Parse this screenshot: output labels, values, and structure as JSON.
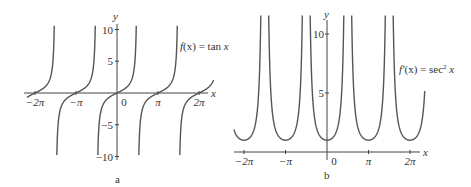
{
  "chart_data": [
    {
      "panel": "a",
      "type": "line",
      "title": "",
      "annotation": "f(x) = tan x",
      "function": "tan x",
      "xlabel": "x",
      "ylabel": "y",
      "xlim": [
        -6.9,
        7.3
      ],
      "ylim": [
        -10,
        11
      ],
      "x_ticks": [
        "−2π",
        "−π",
        "0",
        "π",
        "2π"
      ],
      "y_ticks": [
        "10",
        "5",
        "−5",
        "−10"
      ],
      "asymptotes": [
        "-3π/2",
        "-π/2",
        "π/2",
        "3π/2"
      ],
      "grid": false,
      "caption": "a"
    },
    {
      "panel": "b",
      "type": "line",
      "title": "",
      "annotation": "f′(x) = sec² x",
      "function": "sec^2 x",
      "xlabel": "x",
      "ylabel": "y",
      "xlim": [
        -7,
        7.3
      ],
      "ylim": [
        0,
        11
      ],
      "x_ticks": [
        "−2π",
        "−π",
        "0",
        "π",
        "2π"
      ],
      "y_ticks": [
        "10",
        "5"
      ],
      "minimum_value": 1,
      "asymptotes": [
        "-3π/2",
        "-π/2",
        "π/2",
        "3π/2"
      ],
      "grid": false,
      "caption": "b"
    }
  ],
  "panel_a": {
    "y_axis_label": "y",
    "x_axis_label": "x",
    "ticks_x": [
      "−2π",
      "−π",
      "0",
      "π",
      "2π"
    ],
    "ticks_y": [
      "10",
      "5",
      "−5",
      "−10"
    ],
    "func_label_prefix": "f",
    "func_label_rest": "(x) = tan ",
    "func_label_var": "x",
    "caption": "a"
  },
  "panel_b": {
    "y_axis_label": "y",
    "x_axis_label": "x",
    "ticks_x": [
      "−2π",
      "−π",
      "0",
      "π",
      "2π"
    ],
    "ticks_y": [
      "10",
      "5"
    ],
    "func_label_prefix": "f′",
    "func_label_rest": "(x) = sec",
    "func_label_sup": "2",
    "func_label_var": "x",
    "caption": "b"
  },
  "colors": {
    "curve": "#555555",
    "axis": "#444444",
    "text": "#333333"
  }
}
